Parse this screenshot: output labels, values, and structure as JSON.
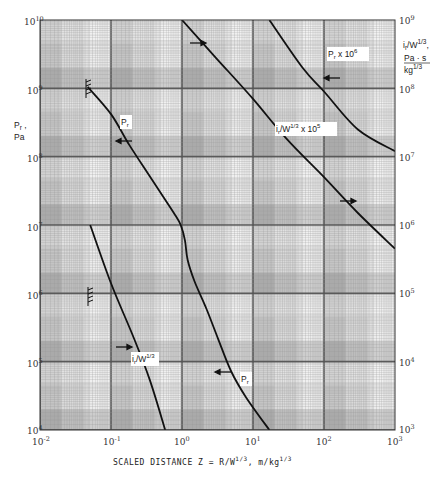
{
  "chart_data": {
    "type": "line",
    "title": "",
    "xlabel": "SCALED DISTANCE  Z = R/W^1/3, m/kg^1/3",
    "ylabel_left": "Pr, Pa",
    "ylabel_right": "ir/W^1/3, Pa·s/kg^1/3",
    "xscale": "log",
    "yscale": "log",
    "xlim": [
      0.01,
      1000
    ],
    "ylim_left": [
      10000,
      10000000000
    ],
    "ylim_right": [
      1000,
      1000000000
    ],
    "grid": true,
    "x_ticks": [
      "10^-2",
      "10^-1",
      "10^0",
      "10^1",
      "10^2",
      "10^3"
    ],
    "y_ticks_left": [
      "10^4",
      "10^5",
      "10^6",
      "10^7",
      "10^8",
      "10^9",
      "10^10"
    ],
    "y_ticks_right": [
      "10^3",
      "10^4",
      "10^5",
      "10^6",
      "10^7",
      "10^8",
      "10^9"
    ],
    "series": [
      {
        "name": "Pr",
        "axis": "left",
        "label": "Pr",
        "x": [
          0.047,
          0.1,
          0.18,
          0.35,
          0.57,
          0.8,
          0.96,
          1.1,
          1.2,
          1.5,
          2.2,
          3.2,
          4.9,
          8.0,
          17
        ],
        "y": [
          1050000000,
          420000000,
          150000000,
          52000000,
          24000000,
          14000000,
          10000000,
          6000000,
          3100000,
          1500000,
          600000,
          220000,
          73000,
          30000,
          10000
        ]
      },
      {
        "name": "ir/W^1/3",
        "axis": "right",
        "label": "ir/W^1/3",
        "x": [
          0.051,
          0.1,
          0.2,
          0.35,
          0.58
        ],
        "y": [
          1000000,
          140000,
          25000,
          5500,
          1000
        ]
      },
      {
        "name": "Pr x 10^6",
        "axis": "right",
        "label": "Pr x 10^6",
        "x": [
          17,
          50,
          100,
          300,
          1000
        ],
        "y": [
          1000000000,
          200000000,
          90000000,
          25000000,
          12000000
        ]
      },
      {
        "name": "ir/W^1/3 x 10^5",
        "axis": "right",
        "label": "ir/W^1/3 x 10^5",
        "x": [
          1.0,
          3.0,
          10,
          30,
          100,
          300,
          1000
        ],
        "y": [
          1000000000,
          280000000,
          70000000,
          18000000,
          5000000,
          1500000,
          450000
        ]
      }
    ],
    "annotations": [
      {
        "text": "Pr",
        "near": "Pr curve upper",
        "arrow": "left"
      },
      {
        "text": "Pr",
        "near": "Pr curve lower",
        "arrow": "left"
      },
      {
        "text": "ir/W^1/3",
        "near": "ir curve",
        "arrow": "right"
      },
      {
        "text": "Pr x 10^6",
        "arrow": "left"
      },
      {
        "text": "ir/W^1/3 x 10^5",
        "arrow": "right"
      }
    ]
  },
  "labels": {
    "left_axis_line1": "P",
    "left_axis_sub": "r",
    "left_axis_comma": " ,",
    "left_axis_line2": "Pa",
    "right_axis_i": "i",
    "right_axis_sub": "r",
    "right_axis_w": "/W",
    "right_axis_exp": "1/3",
    "right_axis_comma": ",",
    "right_axis_unit_num": "Pa · s",
    "right_axis_unit_den": "kg",
    "right_axis_unit_exp": "1/3",
    "xlabel_main": "SCALED DISTANCE  Z = R/W",
    "xlabel_exp1": "1/3",
    "xlabel_unit": ", m/kg",
    "xlabel_exp2": "1/3",
    "curve_pr_upper": "P",
    "curve_pr_upper_sub": "r",
    "curve_pr_lower": "P",
    "curve_pr_lower_sub": "r",
    "curve_ir": "i",
    "curve_ir_sub": "r",
    "curve_ir_rest": "/W",
    "curve_ir_exp": "1/3",
    "curve_pr6": "P",
    "curve_pr6_sub": "r",
    "curve_pr6_rest": " x 10",
    "curve_pr6_exp": "6",
    "curve_ir5": "i",
    "curve_ir5_sub": "r",
    "curve_ir5_rest": "/W",
    "curve_ir5_exp": "1/3",
    "curve_ir5_mult": " x 10",
    "curve_ir5_mult_exp": "5"
  },
  "ticks": {
    "x": [
      {
        "base": "10",
        "exp": "-2"
      },
      {
        "base": "10",
        "exp": "-1"
      },
      {
        "base": "10",
        "exp": "0"
      },
      {
        "base": "10",
        "exp": "1"
      },
      {
        "base": "10",
        "exp": "2"
      },
      {
        "base": "10",
        "exp": "3"
      }
    ],
    "yl": [
      {
        "base": "10",
        "exp": "10"
      },
      {
        "base": "10",
        "exp": "9"
      },
      {
        "base": "10",
        "exp": "8"
      },
      {
        "base": "10",
        "exp": "7"
      },
      {
        "base": "10",
        "exp": "6"
      },
      {
        "base": "10",
        "exp": "5"
      },
      {
        "base": "10",
        "exp": "4"
      }
    ],
    "yr": [
      {
        "base": "10",
        "exp": "9"
      },
      {
        "base": "10",
        "exp": "8"
      },
      {
        "base": "10",
        "exp": "7"
      },
      {
        "base": "10",
        "exp": "6"
      },
      {
        "base": "10",
        "exp": "5"
      },
      {
        "base": "10",
        "exp": "4"
      },
      {
        "base": "10",
        "exp": "3"
      }
    ]
  },
  "colors": {
    "curve": "#111111",
    "grid_dark": "#555555",
    "grid_light": "#9a9a9a",
    "paper": "#e4e4e4"
  }
}
